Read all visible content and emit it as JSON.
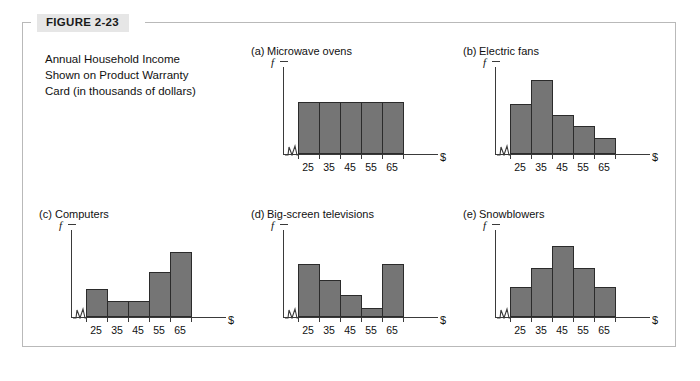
{
  "figure": {
    "label": "FIGURE 2-23",
    "caption_lines": [
      "Annual Household Income",
      "Shown on Product Warranty",
      "Card (in thousands of dollars)"
    ],
    "frame_color": "#b9b9b9",
    "label_bg": "#e6e6e6",
    "bar_fill": "#757575",
    "bar_stroke": "#2b2b2b",
    "axis_color": "#3a3a3a"
  },
  "chart_data": [
    {
      "type": "bar",
      "panel": "(a)",
      "title": "Microwave ovens",
      "categories": [
        "25",
        "35",
        "45",
        "55",
        "65"
      ],
      "values": [
        60,
        60,
        60,
        60,
        60
      ],
      "xlabel": "$",
      "ylabel": "f",
      "ylim": [
        0,
        100
      ],
      "grid": false,
      "legend": "none",
      "shape": "uniform / rectangular"
    },
    {
      "type": "bar",
      "panel": "(b)",
      "title": "Electric fans",
      "categories": [
        "25",
        "35",
        "45",
        "55",
        "65"
      ],
      "values": [
        58,
        86,
        45,
        32,
        19
      ],
      "xlabel": "$",
      "ylabel": "f",
      "ylim": [
        0,
        100
      ],
      "grid": false,
      "legend": "none",
      "shape": "skewed right"
    },
    {
      "type": "bar",
      "panel": "(c)",
      "title": "Computers",
      "categories": [
        "25",
        "35",
        "45",
        "55",
        "65"
      ],
      "values": [
        33,
        19,
        19,
        52,
        76
      ],
      "xlabel": "$",
      "ylabel": "f",
      "ylim": [
        0,
        100
      ],
      "grid": false,
      "legend": "none",
      "shape": "skewed left"
    },
    {
      "type": "bar",
      "panel": "(d)",
      "title": "Big-screen televisions",
      "categories": [
        "25",
        "35",
        "45",
        "55",
        "65"
      ],
      "values": [
        62,
        43,
        26,
        10,
        62
      ],
      "xlabel": "$",
      "ylabel": "f",
      "ylim": [
        0,
        100
      ],
      "grid": false,
      "legend": "none",
      "shape": "J-shaped / bimodal"
    },
    {
      "type": "bar",
      "panel": "(e)",
      "title": "Snowblowers",
      "categories": [
        "25",
        "35",
        "45",
        "55",
        "65"
      ],
      "values": [
        35,
        57,
        82,
        57,
        35
      ],
      "xlabel": "$",
      "ylabel": "f",
      "ylim": [
        0,
        100
      ],
      "grid": false,
      "legend": "none",
      "shape": "symmetric / bell-shaped"
    }
  ]
}
